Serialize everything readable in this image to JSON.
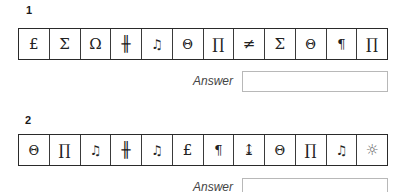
{
  "questions": [
    {
      "number": "1",
      "symbols": [
        {
          "glyph": "£",
          "name": "pound-sign-icon"
        },
        {
          "glyph": "Σ",
          "name": "sigma-icon"
        },
        {
          "glyph": "Ω",
          "name": "omega-icon"
        },
        {
          "glyph": "╫",
          "name": "double-cross-icon"
        },
        {
          "glyph": "♫",
          "name": "music-note-icon"
        },
        {
          "glyph": "Θ",
          "name": "theta-icon"
        },
        {
          "glyph": "∏",
          "name": "pi-product-icon"
        },
        {
          "glyph": "≠",
          "name": "not-equal-icon"
        },
        {
          "glyph": "Σ",
          "name": "sigma-icon"
        },
        {
          "glyph": "Θ",
          "name": "theta-icon"
        },
        {
          "glyph": "¶",
          "name": "pilcrow-icon"
        },
        {
          "glyph": "∏",
          "name": "pi-product-icon"
        }
      ],
      "answer_label": "Answer",
      "answer_value": ""
    },
    {
      "number": "2",
      "symbols": [
        {
          "glyph": "Θ",
          "name": "theta-icon"
        },
        {
          "glyph": "∏",
          "name": "pi-product-icon"
        },
        {
          "glyph": "♫",
          "name": "music-note-icon"
        },
        {
          "glyph": "╫",
          "name": "double-cross-icon"
        },
        {
          "glyph": "♫",
          "name": "music-note-icon"
        },
        {
          "glyph": "£",
          "name": "pound-sign-icon"
        },
        {
          "glyph": "¶",
          "name": "pilcrow-icon"
        },
        {
          "glyph": "↨",
          "name": "up-down-arrow-with-base-icon"
        },
        {
          "glyph": "Θ",
          "name": "theta-icon"
        },
        {
          "glyph": "∏",
          "name": "pi-product-icon"
        },
        {
          "glyph": "♫",
          "name": "music-note-icon"
        },
        {
          "glyph": "☼",
          "name": "sun-icon"
        }
      ],
      "answer_label": "Answer",
      "answer_value": ""
    }
  ]
}
